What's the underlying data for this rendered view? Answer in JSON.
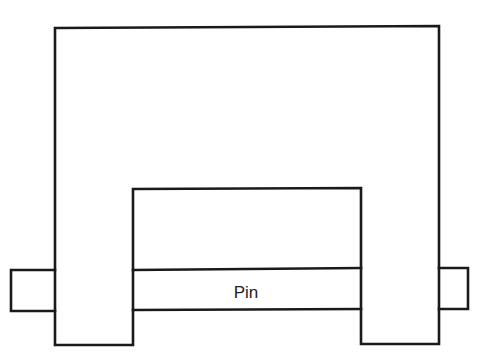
{
  "diagram": {
    "components": [
      {
        "id": "yoke",
        "name": "U-shaped yoke body"
      },
      {
        "id": "pin",
        "name": "Pin",
        "label": "Pin"
      },
      {
        "id": "left-pin-end",
        "name": "Pin end protruding left"
      },
      {
        "id": "right-pin-end",
        "name": "Pin end protruding right"
      }
    ],
    "labels": {
      "pin": "Pin"
    },
    "colors": {
      "line": "#1a1a1a",
      "background": "#ffffff",
      "text": "#222222"
    }
  }
}
